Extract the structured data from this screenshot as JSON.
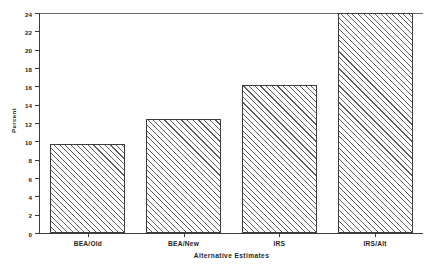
{
  "chart_data": {
    "type": "bar",
    "title": "",
    "xlabel": "Alternative Estimates",
    "ylabel": "Percent",
    "categories": [
      "BEA/Old",
      "BEA/New",
      "IRS",
      "IRS/Alt"
    ],
    "values": [
      9.7,
      12.4,
      16.1,
      24.0
    ],
    "ylim": [
      0,
      24
    ],
    "yticks": [
      0,
      2,
      4,
      6,
      8,
      10,
      12,
      14,
      16,
      18,
      20,
      22,
      24
    ],
    "ytick_labels": [
      "0",
      "2",
      "4",
      "6",
      "8",
      "10",
      "12",
      "14",
      "16",
      "18",
      "20",
      "22",
      "24"
    ],
    "grid": false,
    "legend": null,
    "bar_fill": "hatched-diagonal",
    "bar_edge_color": "#3c3c3c",
    "hatch_color": "#5d5d5d",
    "background": "#ffffff"
  }
}
